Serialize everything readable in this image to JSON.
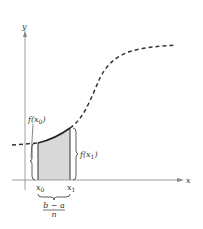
{
  "diagram": {
    "title": "",
    "axes": {
      "x_label": "x",
      "y_label": "y"
    },
    "labels": {
      "f_x0": "f(x",
      "f_x0_sub": "0",
      "f_x0_close": ")",
      "f_x1": "f(x",
      "f_x1_sub": "1",
      "f_x1_close": ")",
      "x0": "x",
      "x0_sub": "0",
      "x1": "x",
      "x1_sub": "1",
      "width_numerator": "b − a",
      "width_denominator": "n"
    },
    "colors": {
      "axis": "#888888",
      "curve": "#333333",
      "shade": "#d9d9d9",
      "text": "#333333"
    }
  }
}
